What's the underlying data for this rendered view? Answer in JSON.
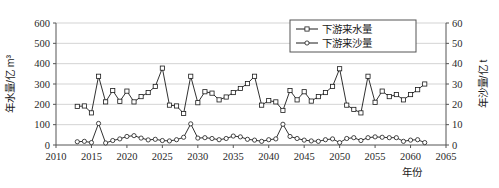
{
  "chart_data": {
    "type": "line",
    "title": "",
    "xlabel": "年份",
    "ylabel": "年水量/亿 m³",
    "y2label": "年沙量/亿 t",
    "xlim": [
      2010,
      2065
    ],
    "ylim": [
      0,
      600
    ],
    "y2lim": [
      0,
      60
    ],
    "xticks": [
      2010,
      2015,
      2020,
      2025,
      2030,
      2035,
      2040,
      2045,
      2050,
      2055,
      2060,
      2065
    ],
    "yticks": [
      0,
      100,
      200,
      300,
      400,
      500,
      600
    ],
    "y2ticks": [
      0,
      10,
      20,
      30,
      40,
      50,
      60
    ],
    "grid": "horizontal",
    "legend_position": "top-right",
    "x": [
      2013,
      2014,
      2015,
      2016,
      2017,
      2018,
      2019,
      2020,
      2021,
      2022,
      2023,
      2024,
      2025,
      2026,
      2027,
      2028,
      2029,
      2030,
      2031,
      2032,
      2033,
      2034,
      2035,
      2036,
      2037,
      2038,
      2039,
      2040,
      2041,
      2042,
      2043,
      2044,
      2045,
      2046,
      2047,
      2048,
      2049,
      2050,
      2051,
      2052,
      2053,
      2054,
      2055,
      2056,
      2057,
      2058,
      2059,
      2060,
      2061,
      2062
    ],
    "series": [
      {
        "name": "下游来水量",
        "axis": "left",
        "marker": "square",
        "unit": "亿 m³",
        "values": [
          190,
          192,
          158,
          338,
          212,
          268,
          215,
          265,
          212,
          238,
          258,
          288,
          378,
          196,
          192,
          155,
          338,
          208,
          262,
          255,
          222,
          236,
          258,
          278,
          302,
          338,
          196,
          218,
          212,
          170,
          268,
          222,
          262,
          216,
          238,
          258,
          288,
          375,
          196,
          175,
          158,
          338,
          210,
          265,
          238,
          248,
          222,
          248,
          272,
          300
        ]
      },
      {
        "name": "下游来沙量",
        "axis": "right",
        "marker": "circle",
        "unit": "亿 t",
        "values": [
          1.6,
          1.8,
          1.2,
          10.6,
          1.0,
          2.2,
          3.0,
          4.2,
          4.6,
          3.4,
          2.5,
          2.8,
          2.2,
          2.0,
          2.6,
          3.8,
          10.4,
          3.4,
          3.6,
          3.2,
          2.6,
          3.2,
          4.4,
          4.0,
          2.8,
          2.4,
          1.8,
          2.6,
          3.0,
          10.2,
          4.2,
          3.2,
          2.4,
          2.0,
          1.8,
          2.6,
          3.0,
          1.2,
          3.2,
          3.6,
          2.2,
          3.6,
          4.0,
          3.8,
          3.6,
          3.6,
          1.8,
          2.4,
          2.6,
          1.2
        ]
      }
    ]
  },
  "legend": {
    "items": [
      {
        "label": "下游来水量",
        "marker": "square"
      },
      {
        "label": "下游来沙量",
        "marker": "circle"
      }
    ]
  },
  "axes": {
    "left_title": "年水量/亿 m³",
    "right_title": "年沙量/亿 t",
    "bottom_title": "年份"
  },
  "colors": {
    "line": "#1a1a1a",
    "grid": "#c8c8c8",
    "axis": "#555555",
    "background": "#ffffff",
    "marker_fill": "#ffffff"
  }
}
